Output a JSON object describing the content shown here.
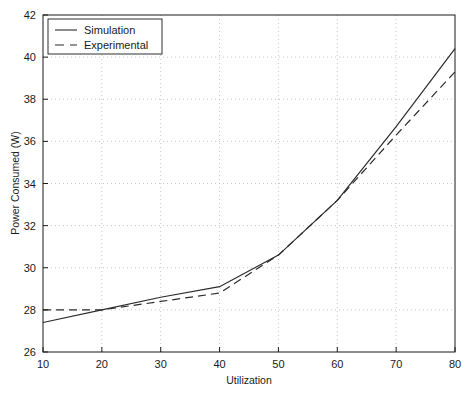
{
  "chart_data": {
    "type": "line",
    "title": "",
    "xlabel": "Utilization",
    "ylabel": "Power Consumed (W)",
    "xlim": [
      10,
      80
    ],
    "ylim": [
      26,
      42
    ],
    "xticks": [
      10,
      20,
      30,
      40,
      50,
      60,
      70,
      80
    ],
    "yticks": [
      26,
      28,
      30,
      32,
      34,
      36,
      38,
      40,
      42
    ],
    "xtick_labels": [
      "10",
      "20",
      "30",
      "40",
      "50",
      "60",
      "70",
      "80"
    ],
    "ytick_labels": [
      "26",
      "28",
      "30",
      "32",
      "34",
      "36",
      "38",
      "40",
      "42"
    ],
    "grid": true,
    "grid_style": "dotted",
    "legend_position": "top-left",
    "x": [
      10,
      20,
      30,
      40,
      50,
      60,
      70,
      80
    ],
    "series": [
      {
        "name": "Simulation",
        "style": "solid",
        "color": "#2b2b2b",
        "values": [
          27.4,
          28.0,
          28.6,
          29.1,
          30.6,
          33.2,
          36.7,
          40.4
        ]
      },
      {
        "name": "Experimental",
        "style": "dashed",
        "color": "#2b2b2b",
        "values": [
          28.0,
          28.0,
          28.4,
          28.8,
          30.6,
          33.2,
          36.3,
          39.3
        ]
      }
    ]
  },
  "legend": {
    "entries": [
      {
        "label": "Simulation",
        "style": "solid"
      },
      {
        "label": "Experimental",
        "style": "dashed"
      }
    ]
  },
  "colors": {
    "axis": "#1a1a1a",
    "grid": "#b9b9b9",
    "line": "#2b2b2b",
    "background": "#ffffff"
  }
}
